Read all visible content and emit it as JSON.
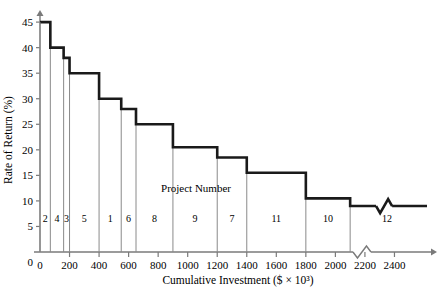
{
  "chart_data": {
    "type": "bar",
    "title": "",
    "subtitle": "",
    "xlabel": "Cumulative Investment ($ × 10³)",
    "ylabel": "Rate of Return (%)",
    "annotation": "Project Number",
    "xlim": [
      0,
      2600
    ],
    "ylim": [
      0,
      46
    ],
    "grid": false,
    "legend": null,
    "axis_break_x": true,
    "axis_break_series": true,
    "xticks": [
      0,
      200,
      400,
      600,
      800,
      1000,
      1200,
      1400,
      1600,
      1800,
      2000,
      2200,
      2400
    ],
    "xtick_labels": [
      "0",
      "200",
      "400",
      "600",
      "800",
      "1000",
      "1200",
      "1400",
      "1600",
      "1800",
      "2000",
      "2200",
      "2400"
    ],
    "yticks": [
      0,
      5,
      10,
      15,
      20,
      25,
      30,
      35,
      40,
      45
    ],
    "ytick_labels": [
      "0",
      "5",
      "10",
      "15",
      "20",
      "25",
      "30",
      "35",
      "40",
      "45"
    ],
    "steps": [
      {
        "project": "2",
        "x_start": 0,
        "x_end": 70,
        "rate": 45.0
      },
      {
        "project": "4",
        "x_start": 70,
        "x_end": 160,
        "rate": 40.0
      },
      {
        "project": "3",
        "x_start": 160,
        "x_end": 200,
        "rate": 38.0
      },
      {
        "project": "5",
        "x_start": 200,
        "x_end": 400,
        "rate": 35.0
      },
      {
        "project": "1",
        "x_start": 400,
        "x_end": 550,
        "rate": 30.0
      },
      {
        "project": "6",
        "x_start": 550,
        "x_end": 650,
        "rate": 28.0
      },
      {
        "project": "8",
        "x_start": 650,
        "x_end": 900,
        "rate": 25.0
      },
      {
        "project": "9",
        "x_start": 900,
        "x_end": 1200,
        "rate": 20.5
      },
      {
        "project": "7",
        "x_start": 1200,
        "x_end": 1400,
        "rate": 18.5
      },
      {
        "project": "11",
        "x_start": 1400,
        "x_end": 1800,
        "rate": 15.5
      },
      {
        "project": "10",
        "x_start": 1800,
        "x_end": 2100,
        "rate": 10.5
      },
      {
        "project": "12",
        "x_start": 2100,
        "x_end": 2600,
        "rate": 9.0
      }
    ]
  },
  "colors": {
    "step_line": "#1a1a1a",
    "divider": "#8a8a8a",
    "axis": "#7a7a7a",
    "text": "#000000"
  }
}
